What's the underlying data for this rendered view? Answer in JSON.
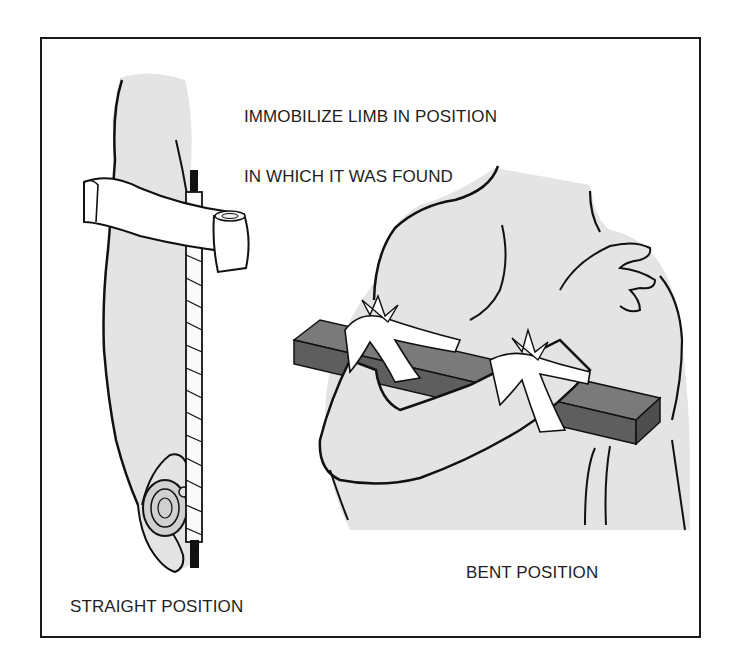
{
  "figure": {
    "title_lines": [
      "IMMOBILIZE LIMB IN POSITION",
      "IN WHICH IT WAS FOUND"
    ],
    "left_panel": {
      "label": "STRAIGHT POSITION",
      "elements": [
        "arm-straight",
        "padded-splint",
        "roller-bandage",
        "bandage-strip"
      ]
    },
    "right_panel": {
      "label": "BENT POSITION",
      "elements": [
        "torso",
        "arm-bent",
        "board-splint",
        "cravat-tie-upper",
        "cravat-tie-lower",
        "hand-on-shoulder"
      ]
    },
    "colors": {
      "skin": "#e4e4e4",
      "outline": "#111111",
      "board": "#6e6e6e",
      "board_side": "#555555",
      "bandage": "#ffffff",
      "splint_tip": "#111111",
      "frame_border": "#1a1a1a",
      "text": "#1e1e1e"
    }
  }
}
